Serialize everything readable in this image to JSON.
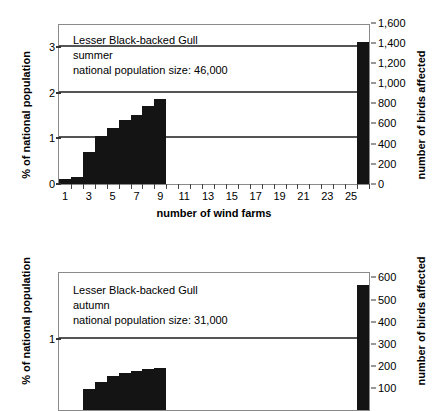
{
  "chart_data": [
    {
      "id": "top",
      "type": "bar",
      "title": "Lesser Black-backed Gull",
      "season": "summer",
      "population_note": "national population size: 46,000",
      "xlabel": "number of wind farms",
      "ylabel": "% of national population",
      "ylabel_right": "number of birds affected",
      "xlim": [
        0.5,
        26.5
      ],
      "ylim": [
        0,
        3.48
      ],
      "yticks": [
        0,
        1,
        2,
        3
      ],
      "ylim_right": [
        0,
        1600
      ],
      "yticks_right": [
        "0",
        "200",
        "400",
        "600",
        "800",
        "1,000",
        "1,200",
        "1,400",
        "1,600"
      ],
      "xticks": [
        1,
        2,
        3,
        4,
        5,
        6,
        7,
        8,
        9,
        10,
        11,
        12,
        13,
        14,
        15,
        16,
        17,
        18,
        19,
        20,
        21,
        22,
        23,
        24,
        25,
        26
      ],
      "xticklabels": [
        "1",
        "",
        "3",
        "",
        "5",
        "",
        "7",
        "",
        "9",
        "",
        "11",
        "",
        "13",
        "",
        "15",
        "",
        "17",
        "",
        "19",
        "",
        "21",
        "",
        "23",
        "",
        "25",
        ""
      ],
      "grid": "horizontal gridlines at 1, 2",
      "categories": [
        1,
        2,
        3,
        4,
        5,
        6,
        7,
        8,
        9,
        26
      ],
      "values": [
        0.1,
        0.16,
        0.71,
        1.05,
        1.23,
        1.41,
        1.52,
        1.71,
        1.85,
        3.11
      ],
      "values_birds": [
        46,
        74,
        327,
        483,
        566,
        649,
        699,
        787,
        851,
        1431
      ],
      "annotation_line": {
        "y": 3.0,
        "y_birds": 1400,
        "x_start": 14,
        "x_end": 26
      }
    },
    {
      "id": "bottom",
      "type": "bar",
      "title": "Lesser Black-backed Gull",
      "season": "autumn",
      "population_note": "national population size: 31,000",
      "ylabel": "% of national population",
      "ylabel_right": "number of birds affected",
      "xlim": [
        0.5,
        26.5
      ],
      "ylim": [
        0,
        1.935
      ],
      "yticks": [
        1
      ],
      "ylim_right": [
        0,
        600
      ],
      "yticks_right": [
        "100",
        "200",
        "300",
        "400",
        "500",
        "600"
      ],
      "grid": "horizontal gridline at 1",
      "categories": [
        3,
        4,
        5,
        6,
        7,
        8,
        9,
        26
      ],
      "values": [
        0.3,
        0.39,
        0.48,
        0.52,
        0.55,
        0.58,
        0.6,
        1.76
      ],
      "values_birds": [
        93,
        121,
        149,
        161,
        171,
        180,
        186,
        545
      ],
      "note": "chart is cropped at the bottom edge of the screenshot"
    }
  ],
  "top": {
    "caption": {
      "line1": "Lesser Black-backed Gull",
      "line2": "summer",
      "line3": "national population size: 46,000"
    },
    "axis": {
      "ylabel_left": "% of national population",
      "ylabel_right": "number of birds affected",
      "xlabel": "number of wind farms"
    },
    "yticks_left": [
      "0",
      "1",
      "2",
      "3"
    ],
    "yticks_right": [
      "0",
      "200",
      "400",
      "600",
      "800",
      "1,000",
      "1,200",
      "1,400",
      "1,600"
    ],
    "xticklabels": [
      "1",
      "3",
      "5",
      "7",
      "9",
      "11",
      "13",
      "15",
      "17",
      "19",
      "21",
      "23",
      "25"
    ]
  },
  "bottom": {
    "caption": {
      "line1": "Lesser Black-backed Gull",
      "line2": "autumn",
      "line3": "national population size: 31,000"
    },
    "axis": {
      "ylabel_left": "% of national population",
      "ylabel_right": "number of birds affected"
    },
    "yticks_left": [
      "1"
    ],
    "yticks_right": [
      "100",
      "200",
      "300",
      "400",
      "500",
      "600"
    ]
  },
  "colors": {
    "bar": "#141414",
    "gridline": "#555555",
    "frame": "#8a8a8a"
  }
}
